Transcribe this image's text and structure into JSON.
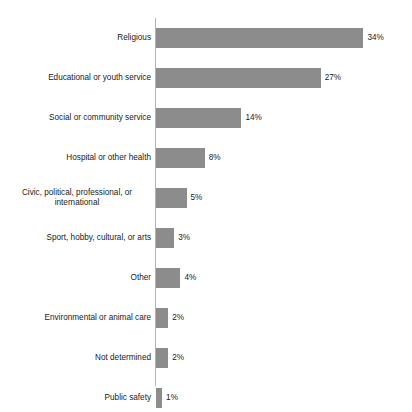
{
  "chart_data": {
    "type": "bar",
    "orientation": "horizontal",
    "title": "",
    "xlabel": "",
    "ylabel": "",
    "xlim": [
      0,
      34
    ],
    "grid": false,
    "legend": null,
    "value_suffix": "%",
    "bar_color": "#8c8c8c",
    "axis_color": "#b4b4b4",
    "text_color": "#1a1a1a",
    "categories": [
      "Religious",
      "Educational or youth service",
      "Social or community service",
      "Hospital or other health",
      "Civic, political, professional, or\ninternational",
      "Sport, hobby, cultural, or arts",
      "Other",
      "Environmental or animal care",
      "Not determined",
      "Public safety"
    ],
    "values": [
      34,
      27,
      14,
      8,
      5,
      3,
      4,
      2,
      2,
      1
    ],
    "value_labels": [
      "34%",
      "27%",
      "14%",
      "8%",
      "5%",
      "3%",
      "4%",
      "2%",
      "2%",
      "1%"
    ]
  },
  "rows": [
    {
      "label": "Religious",
      "value": 34,
      "value_label": "34%",
      "wrapped": false
    },
    {
      "label": "Educational or youth service",
      "value": 27,
      "value_label": "27%",
      "wrapped": false
    },
    {
      "label": "Social or community service",
      "value": 14,
      "value_label": "14%",
      "wrapped": false
    },
    {
      "label": "Hospital or other health",
      "value": 8,
      "value_label": "8%",
      "wrapped": false
    },
    {
      "label": "Civic, political, professional, or\ninternational",
      "value": 5,
      "value_label": "5%",
      "wrapped": true
    },
    {
      "label": "Sport, hobby, cultural, or arts",
      "value": 3,
      "value_label": "3%",
      "wrapped": false
    },
    {
      "label": "Other",
      "value": 4,
      "value_label": "4%",
      "wrapped": false
    },
    {
      "label": "Environmental or animal care",
      "value": 2,
      "value_label": "2%",
      "wrapped": false
    },
    {
      "label": "Not determined",
      "value": 2,
      "value_label": "2%",
      "wrapped": false
    },
    {
      "label": "Public safety",
      "value": 1,
      "value_label": "1%",
      "wrapped": false
    }
  ]
}
